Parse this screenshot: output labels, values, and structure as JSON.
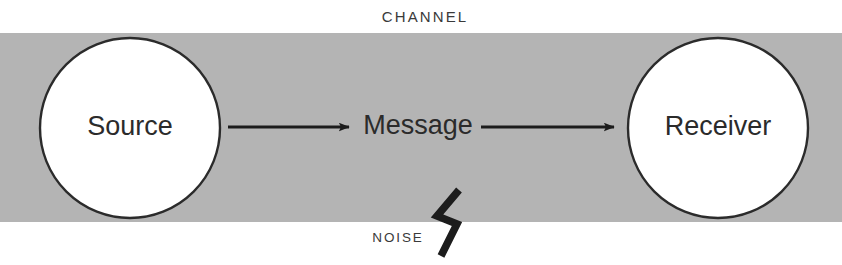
{
  "diagram": {
    "canvas": {
      "width": 842,
      "height": 265,
      "background": "#ffffff"
    },
    "channel": {
      "label": "CHANNEL",
      "fill": "#b4b4b4",
      "top": 33,
      "bottom": 222,
      "label_x": 425,
      "label_y": 18
    },
    "nodes": [
      {
        "id": "source",
        "label": "Source",
        "shape": "circle",
        "cx": 130,
        "cy": 128,
        "r": 90,
        "fill": "#ffffff",
        "stroke": "#2b2b2b"
      },
      {
        "id": "receiver",
        "label": "Receiver",
        "shape": "circle",
        "cx": 718,
        "cy": 128,
        "r": 90,
        "fill": "#ffffff",
        "stroke": "#2b2b2b"
      }
    ],
    "message": {
      "label": "Message",
      "x": 418,
      "y": 127
    },
    "arrows": [
      {
        "id": "source-to-message",
        "x1": 228,
        "x2": 349,
        "y": 127,
        "color": "#1c1c1c"
      },
      {
        "id": "message-to-receiver",
        "x1": 481,
        "x2": 614,
        "y": 127,
        "color": "#1c1c1c"
      }
    ],
    "noise": {
      "label": "NOISE",
      "label_x": 398,
      "label_y": 238,
      "bolt_color": "#1c1c1c",
      "bolt_points": "459,190 437,216 457,224 441,256"
    }
  }
}
